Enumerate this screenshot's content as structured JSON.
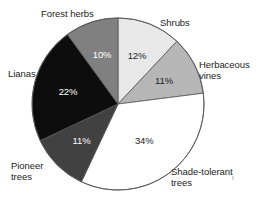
{
  "chart_data": {
    "type": "pie",
    "title": "",
    "subtitle": "",
    "xlabel": "",
    "ylabel": "",
    "legend_position": "outside-labels",
    "grid": false,
    "start_angle_deg": 0,
    "direction": "clockwise",
    "units": "percent",
    "categories": [
      "Shrubs",
      "Herbaceous vines",
      "Shade-tolerant trees",
      "Pioneer trees",
      "Lianas",
      "Forest herbs"
    ],
    "values": [
      12,
      11,
      34,
      11,
      22,
      10
    ],
    "slices": [
      {
        "label": "Shrubs",
        "label_line1": "Shrubs",
        "label_line2": "",
        "value": 12,
        "value_label": "12%",
        "color": "#e8e8e8",
        "text_color": "#1c1c1c",
        "text_on_dark": false
      },
      {
        "label": "Herbaceous vines",
        "label_line1": "Herbaceous",
        "label_line2": "vines",
        "value": 11,
        "value_label": "11%",
        "color": "#b6b6b6",
        "text_color": "#1c1c1c",
        "text_on_dark": false
      },
      {
        "label": "Shade-tolerant trees",
        "label_line1": "Shade-tolerant",
        "label_line2": "trees",
        "value": 34,
        "value_label": "34%",
        "color": "#ffffff",
        "text_color": "#1c1c1c",
        "text_on_dark": false
      },
      {
        "label": "Pioneer trees",
        "label_line1": "Pioneer",
        "label_line2": "trees",
        "value": 11,
        "value_label": "11%",
        "color": "#414141",
        "text_color": "#ffffff",
        "text_on_dark": true
      },
      {
        "label": "Lianas",
        "label_line1": "Lianas",
        "label_line2": "",
        "value": 22,
        "value_label": "22%",
        "color": "#0d0d0d",
        "text_color": "#ffffff",
        "text_on_dark": true
      },
      {
        "label": "Forest herbs",
        "label_line1": "Forest herbs",
        "label_line2": "",
        "value": 10,
        "value_label": "10%",
        "color": "#808080",
        "text_color": "#ffffff",
        "text_on_dark": true
      }
    ],
    "geometry": {
      "center_x": 118,
      "center_y": 104,
      "radius": 86
    },
    "colors": {
      "background": "#ffffff",
      "slice_outline": "#585858",
      "label_text": "#1c1c1c"
    }
  }
}
